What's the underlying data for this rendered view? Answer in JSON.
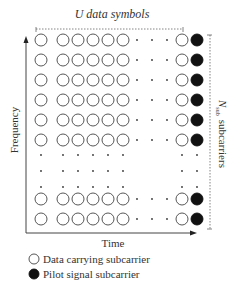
{
  "title": "U data symbols",
  "axes": {
    "x_label": "Time",
    "y_label": "Frequency"
  },
  "bracket_label": {
    "symbol": "N",
    "subscript": "sub",
    "text": "subcarriers"
  },
  "legend": [
    {
      "marker": "open-circle",
      "label": "Data carrying subcarrier"
    },
    {
      "marker": "filled-circle",
      "label": "Pilot signal subcarrier"
    }
  ],
  "grid": {
    "rows": [
      "symbol",
      "symbol",
      "symbol",
      "symbol",
      "symbol",
      "symbol",
      "ellipsis",
      "ellipsis",
      "ellipsis",
      "symbol",
      "symbol"
    ],
    "columns": [
      "data",
      "data",
      "data",
      "data",
      "data",
      "data",
      "ellipsis",
      "ellipsis",
      "ellipsis",
      "data",
      "pilot"
    ]
  },
  "colors": {
    "data_fill": "#ffffff",
    "pilot_fill": "#111111",
    "stroke": "#444444"
  }
}
